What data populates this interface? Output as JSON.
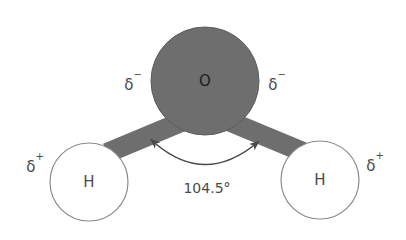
{
  "figure": {
    "type": "molecular-structure-diagram",
    "background_color": "#ffffff",
    "width": 406,
    "height": 240
  },
  "atoms": {
    "oxygen": {
      "symbol": "O",
      "name": "oxygen-atom",
      "fill_color": "#6e6e6e",
      "stroke_color": "#5d5d5d",
      "label_color": "#1d1d1d",
      "cx": 205,
      "cy": 81,
      "r": 54
    },
    "hydrogen_left": {
      "symbol": "H",
      "name": "hydrogen-atom-left",
      "fill_color": "#ffffff",
      "stroke_color": "#8a8a8a",
      "label_color": "#4a4a4a",
      "cx": 89,
      "cy": 182,
      "r": 39
    },
    "hydrogen_right": {
      "symbol": "H",
      "name": "hydrogen-atom-right",
      "fill_color": "#ffffff",
      "stroke_color": "#8a8a8a",
      "label_color": "#4a4a4a",
      "cx": 320,
      "cy": 180,
      "r": 39
    }
  },
  "bonds": {
    "color": "#6e6e6e",
    "width": 20,
    "left": {
      "name": "bond-oxygen-hydrogen-left",
      "x1": 186,
      "y1": 120,
      "x2": 107,
      "y2": 153
    },
    "right": {
      "name": "bond-oxygen-hydrogen-right",
      "x1": 226,
      "y1": 120,
      "x2": 303,
      "y2": 152
    }
  },
  "charge_labels": {
    "delta": "δ",
    "negative_sign": "−",
    "positive_sign": "+",
    "color": "#4a4a4a",
    "oxygen_left": {
      "name": "partial-charge-oxygen-left",
      "text": "δ−",
      "x": 133,
      "y": 85
    },
    "oxygen_right": {
      "name": "partial-charge-oxygen-right",
      "text": "δ−",
      "x": 277,
      "y": 85
    },
    "hydrogen_left": {
      "name": "partial-charge-hydrogen-left",
      "text": "δ+",
      "x": 35,
      "y": 167
    },
    "hydrogen_right": {
      "name": "partial-charge-hydrogen-right",
      "text": "δ+",
      "x": 375,
      "y": 166
    }
  },
  "angle": {
    "name": "bond-angle-annotation",
    "value": "104.5°",
    "numeric_value": 104.5,
    "unit": "degrees",
    "label_x": 207,
    "label_y": 188,
    "arc_color": "#4a4a4a",
    "arc_path": "M 156 144 Q 206 186 258 142"
  }
}
